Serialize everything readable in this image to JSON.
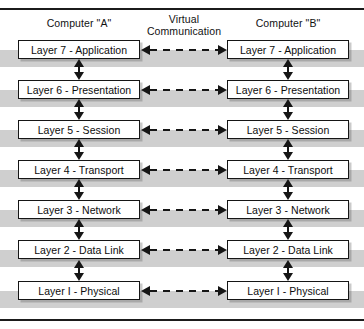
{
  "frame": {
    "top_rule": "top-rule",
    "bottom_rule": "bottom-rule"
  },
  "headers": {
    "computer_a": "Computer \"A\"",
    "computer_b": "Computer \"B\"",
    "virtual_line1": "Virtual",
    "virtual_line2": "Communication"
  },
  "colors": {
    "box_border": "#151515",
    "box_fill": "#ffffff",
    "shadow_band": "#cfcfcf",
    "arrow": "#151515",
    "text": "#0d0d0d",
    "page_background": "#ffffff"
  },
  "layers": [
    {
      "number": 7,
      "name": "Application",
      "left_label": "Layer 7 - Application",
      "right_label": "Layer 7 - Application",
      "top": 40,
      "band_top": 50
    },
    {
      "number": 6,
      "name": "Presentation",
      "left_label": "Layer 6 - Presentation",
      "right_label": "Layer 6 - Presentation",
      "top": 80,
      "band_top": 90
    },
    {
      "number": 5,
      "name": "Session",
      "left_label": "Layer 5 - Session",
      "right_label": "Layer 5 - Session",
      "top": 120,
      "band_top": 130
    },
    {
      "number": 4,
      "name": "Transport",
      "left_label": "Layer 4 - Transport",
      "right_label": "Layer 4 - Transport",
      "top": 160,
      "band_top": 170
    },
    {
      "number": 3,
      "name": "Network",
      "left_label": "Layer 3 - Network",
      "right_label": "Layer 3 - Network",
      "top": 200,
      "band_top": 210
    },
    {
      "number": 2,
      "name": "Data Link",
      "left_label": "Layer 2 - Data Link",
      "right_label": "Layer 2 - Data Link",
      "top": 240,
      "band_top": 250
    },
    {
      "number": 1,
      "name": "Physical",
      "left_label": "Layer I - Physical",
      "right_label": "Layer I - Physical",
      "top": 281,
      "band_top": 291
    }
  ],
  "horizontal_arrows": [
    {
      "layer": 7,
      "top": 44,
      "style": "dashed",
      "direction": "bidirectional"
    },
    {
      "layer": 6,
      "top": 84,
      "style": "dashed",
      "direction": "bidirectional"
    },
    {
      "layer": 5,
      "top": 124,
      "style": "dashed",
      "direction": "bidirectional"
    },
    {
      "layer": 4,
      "top": 164,
      "style": "dashed",
      "direction": "bidirectional"
    },
    {
      "layer": 3,
      "top": 204,
      "style": "dashed",
      "direction": "bidirectional"
    },
    {
      "layer": 2,
      "top": 244,
      "style": "dashed",
      "direction": "bidirectional"
    },
    {
      "layer": 1,
      "top": 285,
      "style": "dashed",
      "direction": "bidirectional"
    }
  ],
  "vertical_arrows": [
    {
      "between": "7-6",
      "top": 59,
      "style": "solid",
      "direction": "bidirectional"
    },
    {
      "between": "6-5",
      "top": 99,
      "style": "solid",
      "direction": "bidirectional"
    },
    {
      "between": "5-4",
      "top": 139,
      "style": "solid",
      "direction": "bidirectional"
    },
    {
      "between": "4-3",
      "top": 179,
      "style": "solid",
      "direction": "bidirectional"
    },
    {
      "between": "3-2",
      "top": 219,
      "style": "solid",
      "direction": "bidirectional"
    },
    {
      "between": "2-1",
      "top": 260,
      "style": "solid",
      "direction": "bidirectional"
    }
  ]
}
